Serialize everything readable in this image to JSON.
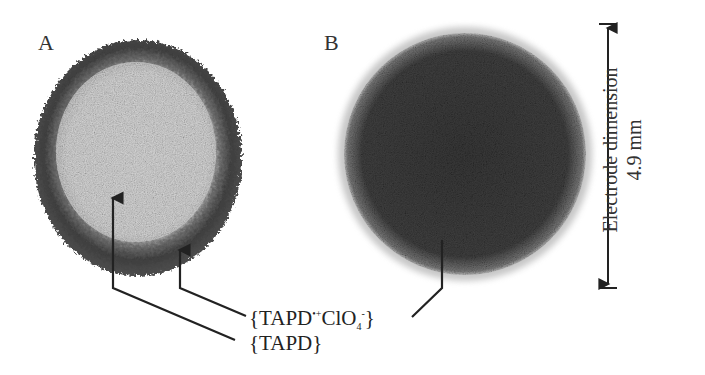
{
  "panels": {
    "a": {
      "label": "A",
      "description": "electrode with light center and dark rim"
    },
    "b": {
      "label": "B",
      "description": "fully dark electrode"
    }
  },
  "annotations": {
    "species_radical": {
      "base": "{TAPD",
      "sup": "•+",
      "mid": "ClO",
      "sub": "4",
      "sup2": "-",
      "end": "}"
    },
    "species_neutral": "{TAPD}"
  },
  "scale_bar": {
    "title": "Electrode dimension",
    "value": "4.9 mm"
  },
  "colors": {
    "rim_dark": "#3a3a3a",
    "center_light": "#d4d4d4",
    "disc_b": "#3b3b3b",
    "line": "#222222"
  }
}
